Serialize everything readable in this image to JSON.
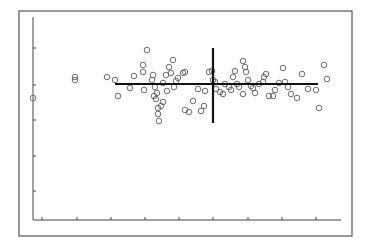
{
  "chart_data": {
    "type": "scatter",
    "title": "",
    "xlabel": "",
    "ylabel": "",
    "grid": false,
    "legend": null,
    "note": "No tick labels visible; coordinates are in plot-pixel units measured from the axis origin (x right, y up).",
    "xlim": [
      0,
      308
    ],
    "ylim": [
      0,
      203
    ],
    "x_ticks": [
      9,
      44,
      78,
      112,
      146,
      180,
      215,
      249,
      283
    ],
    "y_ticks": [
      29,
      64,
      100,
      135,
      172
    ],
    "marker": "open-circle",
    "marker_color": "#6a6a6a",
    "points": [
      [
        0,
        122
      ],
      [
        42,
        143
      ],
      [
        42,
        140
      ],
      [
        74,
        143
      ],
      [
        82,
        140
      ],
      [
        85,
        124
      ],
      [
        97,
        132
      ],
      [
        101,
        144
      ],
      [
        110,
        148
      ],
      [
        110,
        155
      ],
      [
        111,
        130
      ],
      [
        114,
        170
      ],
      [
        119,
        140
      ],
      [
        120,
        145
      ],
      [
        121,
        124
      ],
      [
        122,
        133
      ],
      [
        123,
        121
      ],
      [
        124,
        127
      ],
      [
        125,
        112
      ],
      [
        125,
        106
      ],
      [
        126,
        99
      ],
      [
        128,
        114
      ],
      [
        130,
        118
      ],
      [
        130,
        137
      ],
      [
        133,
        145
      ],
      [
        134,
        129
      ],
      [
        136,
        153
      ],
      [
        138,
        147
      ],
      [
        140,
        160
      ],
      [
        141,
        133
      ],
      [
        143,
        139
      ],
      [
        145,
        142
      ],
      [
        150,
        147
      ],
      [
        152,
        148
      ],
      [
        152,
        110
      ],
      [
        156,
        108
      ],
      [
        160,
        119
      ],
      [
        165,
        131
      ],
      [
        168,
        109
      ],
      [
        171,
        114
      ],
      [
        172,
        129
      ],
      [
        176,
        148
      ],
      [
        179,
        149
      ],
      [
        180,
        140
      ],
      [
        182,
        138
      ],
      [
        183,
        131
      ],
      [
        187,
        128
      ],
      [
        190,
        126
      ],
      [
        192,
        136
      ],
      [
        196,
        133
      ],
      [
        198,
        130
      ],
      [
        200,
        143
      ],
      [
        202,
        149
      ],
      [
        204,
        136
      ],
      [
        206,
        133
      ],
      [
        210,
        126
      ],
      [
        210,
        159
      ],
      [
        212,
        153
      ],
      [
        213,
        148
      ],
      [
        215,
        140
      ],
      [
        218,
        134
      ],
      [
        220,
        132
      ],
      [
        222,
        127
      ],
      [
        226,
        136
      ],
      [
        230,
        138
      ],
      [
        231,
        143
      ],
      [
        233,
        146
      ],
      [
        236,
        124
      ],
      [
        240,
        124
      ],
      [
        242,
        130
      ],
      [
        246,
        137
      ],
      [
        250,
        152
      ],
      [
        252,
        138
      ],
      [
        255,
        133
      ],
      [
        258,
        126
      ],
      [
        264,
        122
      ],
      [
        269,
        146
      ],
      [
        275,
        131
      ],
      [
        283,
        130
      ],
      [
        286,
        112
      ],
      [
        291,
        155
      ],
      [
        294,
        141
      ]
    ],
    "crosshair": {
      "center": [
        180,
        136
      ],
      "x_range": [
        82,
        285
      ],
      "y_range": [
        97,
        172
      ],
      "color": "#111111"
    }
  },
  "layout": {
    "frame": {
      "x": 19,
      "y": 11,
      "w": 333,
      "h": 225
    },
    "origin": {
      "x": 33,
      "y": 220
    },
    "x_axis_end": 341,
    "y_axis_top": 17
  }
}
